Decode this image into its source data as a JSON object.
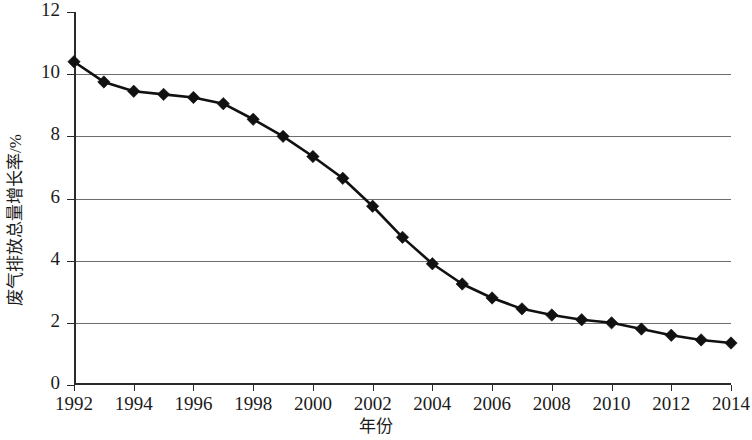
{
  "chart_data": {
    "type": "line",
    "title": "",
    "xlabel": "年份",
    "ylabel": "废气排放总量增长率/%",
    "x": [
      1992,
      1993,
      1994,
      1995,
      1996,
      1997,
      1998,
      1999,
      2000,
      2001,
      2002,
      2003,
      2004,
      2005,
      2006,
      2007,
      2008,
      2009,
      2010,
      2011,
      2012,
      2013,
      2014
    ],
    "values": [
      10.4,
      9.75,
      9.45,
      9.35,
      9.25,
      9.05,
      8.55,
      8.0,
      7.35,
      6.65,
      5.75,
      4.75,
      3.9,
      3.25,
      2.8,
      2.45,
      2.25,
      2.1,
      2.0,
      1.8,
      1.6,
      1.45,
      1.35
    ],
    "categories": [
      "1992",
      "1993",
      "1994",
      "1995",
      "1996",
      "1997",
      "1998",
      "1999",
      "2000",
      "2001",
      "2002",
      "2003",
      "2004",
      "2005",
      "2006",
      "2007",
      "2008",
      "2009",
      "2010",
      "2011",
      "2012",
      "2013",
      "2014"
    ],
    "series": [
      {
        "name": "废气排放总量增长率",
        "values": [
          10.4,
          9.75,
          9.45,
          9.35,
          9.25,
          9.05,
          8.55,
          8.0,
          7.35,
          6.65,
          5.75,
          4.75,
          3.9,
          3.25,
          2.8,
          2.45,
          2.25,
          2.1,
          2.0,
          1.8,
          1.6,
          1.45,
          1.35
        ]
      }
    ],
    "xlim": [
      1992,
      2014
    ],
    "ylim": [
      0,
      12
    ],
    "ytick_values": [
      0,
      2,
      4,
      6,
      8,
      10,
      12
    ],
    "ytick_labels": [
      "0",
      "2",
      "4",
      "6",
      "8",
      "10",
      "12"
    ],
    "xtick_values": [
      1992,
      1994,
      1996,
      1998,
      2000,
      2002,
      2004,
      2006,
      2008,
      2010,
      2012,
      2014
    ],
    "xtick_labels": [
      "1992",
      "1994",
      "1996",
      "1998",
      "2000",
      "2002",
      "2004",
      "2006",
      "2008",
      "2010",
      "2012",
      "2014"
    ],
    "gridline_values": [
      2,
      4,
      6,
      8,
      10
    ],
    "grid": true,
    "legend": "none",
    "marker": "diamond",
    "line_color": "#111111",
    "marker_color": "#111111",
    "grid_color": "#6e6e6e",
    "axis_color": "#2a2a2a",
    "background": "#ffffff"
  }
}
